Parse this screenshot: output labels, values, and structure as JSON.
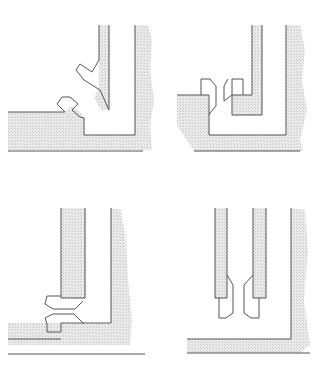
{
  "figure": {
    "width": 331,
    "height": 377,
    "background": "#ffffff",
    "shade_color": "#e2e2e2",
    "line_color": "#555555",
    "panel_count": 4
  },
  "panels": [
    {
      "id": "top-left",
      "label": "diagonal-seal-corner",
      "shaded": [
        "M8,112 L65,112 L72,106 L80,112 L84,118 L84,135 L135,135 L135,25 L148,25 L152,40 L150,70 L154,100 L150,125 L152,150 L8,150 Z",
        "M99,25 L109,25 L109,110 L101,110 L94,98 L99,88 Z"
      ],
      "lines": [
        "M8,112 L65,112",
        "M65,112 L57,104 L62,97 L70,97 L78,104 L72,110 L80,117 L84,118 L84,135 L135,135 L135,25",
        "M99,25 L99,60 L92,72 L80,64 L76,70 L84,80 L100,90 L109,110 L109,25",
        "M8,151 L143,151"
      ]
    },
    {
      "id": "top-right",
      "label": "opposed-u-seals",
      "shaded": [
        "M177,95 L209,95 L209,115 L210,135 L286,135 L286,25 L300,25 L305,50 L302,80 L307,110 L300,140 L303,151 L194,151 L177,125 Z",
        "M252,25 L262,25 L262,115 L232,115 L232,95 L252,95 Z"
      ],
      "lines": [
        "M177,95 L209,95",
        "M201,95 L201,79 L210,79 L216,86 L216,106 L210,113 L209,115",
        "M209,95 L209,135 L286,135 L286,25",
        "M232,95 L232,79 L243,79 L243,95",
        "M232,95 L224,101 L224,86 L228,79",
        "M252,25 L252,95 L232,95 L232,115 L262,115 L262,25",
        "M194,151 L300,151"
      ]
    },
    {
      "id": "bottom-left",
      "label": "stacked-horizontal-seals",
      "shaded": [
        "M61,208 L85,208 L85,298 L61,298 Z",
        "M8,339 L8,323 L61,323 L61,324 L111,324 L111,208 L121,210 L126,240 L128,280 L132,320 L130,345 L8,345 Z"
      ],
      "lines": [
        "M61,208 L61,298 L85,298 L85,208",
        "M61,296 L47,296 L45,304 L53,309 L75,309 L83,301",
        "M47,324 L45,318 L53,314 L74,314 L84,324",
        "M47,324 L47,332 L61,332 L61,323 L111,323 L111,208",
        "M8,339 L61,339",
        "M8,354 L145,354"
      ]
    },
    {
      "id": "bottom-right",
      "label": "vertical-twin-seals",
      "shaded": [
        "M215,208 L227,208 L227,298 L215,298 Z",
        "M253,208 L266,208 L266,298 L253,298 Z",
        "M187,339 L291,339 L291,208 L305,210 L308,250 L304,300 L310,345 L300,353 L187,353 Z"
      ],
      "lines": [
        "M215,208 L215,298 L227,298 L227,208",
        "M253,208 L253,298 L266,298 L266,208",
        "M227,275 L233,285 L233,313 L226,318 L219,318 L219,298",
        "M253,275 L244,285 L244,313 L251,318 L259,318 L259,298",
        "M187,339 L291,339 L291,208",
        "M187,353 L310,353"
      ]
    }
  ]
}
